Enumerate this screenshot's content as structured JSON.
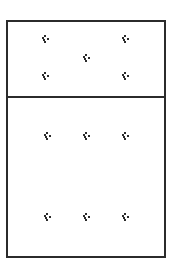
{
  "diagram": {
    "frame": {
      "border_color": "#2b2b2b",
      "background": "#ffffff"
    },
    "sections": [
      {
        "name": "top",
        "glyph_count": 5,
        "arrangement": "quincunx"
      },
      {
        "name": "bottom",
        "glyph_count": 6,
        "arrangement": "2 rows x 3 columns"
      }
    ],
    "glyph_icon": "dot-cluster-icon",
    "glyph_color": "#2b2b2b"
  }
}
